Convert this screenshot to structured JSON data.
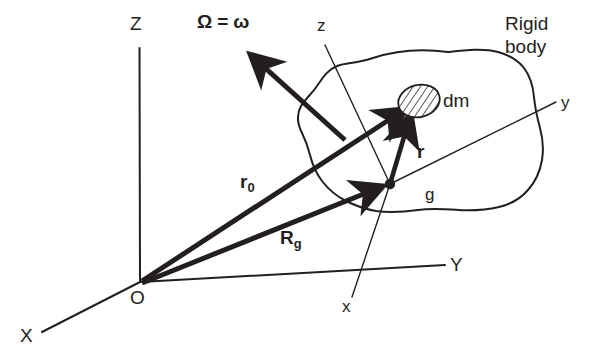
{
  "figure": {
    "background_color": "#ffffff",
    "ink_color": "#231f20"
  },
  "labels": {
    "global_z": "Z",
    "global_y": "Y",
    "global_x": "X",
    "origin": "O",
    "body_z": "z",
    "body_y": "y",
    "body_x": "x",
    "center_of_gravity": "g",
    "mass_element": "dm",
    "rigid_body": "Rigid\nbody",
    "angular_velocity_symbol": "Ω",
    "angular_velocity_equals": "=",
    "angular_velocity_omega": "ω",
    "vector_r0_base": "r",
    "vector_r0_sub": "0",
    "vector_rg_base": "R",
    "vector_rg_sub": "g",
    "vector_r": "r"
  },
  "elements": {
    "global_frame_name": "inertial-frame-XYZ",
    "body_frame_name": "body-fixed-frame-xyz",
    "blob_name": "rigid-body-outline",
    "dm_name": "mass-element-ellipse"
  },
  "geometry": {
    "origin": [
      140,
      282
    ],
    "center_of_gravity": [
      390,
      184
    ],
    "mass_element": [
      418,
      102
    ],
    "global_z_top": [
      136,
      48
    ],
    "global_y_end": [
      445,
      265
    ],
    "global_x_end": [
      42,
      332
    ],
    "body_z_top": [
      325,
      45
    ],
    "body_y_end": [
      556,
      102
    ],
    "body_x_end": [
      352,
      297
    ],
    "omega_tail": [
      345,
      140
    ],
    "omega_head": [
      245,
      50
    ]
  }
}
